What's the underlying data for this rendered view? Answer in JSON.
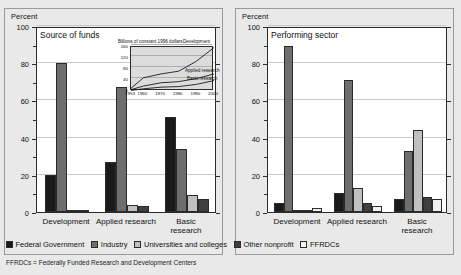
{
  "axis_unit_label": "Percent",
  "panels": [
    {
      "id": "source",
      "title": "Source of funds"
    },
    {
      "id": "sector",
      "title": "Performing sector"
    }
  ],
  "legend": [
    {
      "label": "Federal Government",
      "color": "#1a1a1a"
    },
    {
      "label": "Industry",
      "color": "#6e6e6e"
    },
    {
      "label": "Universities and colleges",
      "color": "#c0c0c0"
    },
    {
      "label": "Other nonprofit",
      "color": "#3f3f3f"
    },
    {
      "label": "FFRDCs",
      "color": "#f2f2f2"
    }
  ],
  "footnote": "FFRDCs = Federally Funded Research and Development Centers",
  "chart_data": [
    {
      "type": "bar",
      "title": "Source of funds",
      "xlabel": "",
      "ylabel": "Percent",
      "ylim": [
        0,
        100
      ],
      "yticks": [
        0,
        20,
        40,
        60,
        80,
        100
      ],
      "grid": true,
      "legend_position": "bottom",
      "categories": [
        "Development",
        "Applied research",
        "Basic research"
      ],
      "series": [
        {
          "name": "Federal Government",
          "color": "#1a1a1a",
          "values": [
            20,
            27,
            51
          ]
        },
        {
          "name": "Industry",
          "color": "#6e6e6e",
          "values": [
            80,
            67,
            34
          ]
        },
        {
          "name": "Universities and colleges",
          "color": "#c0c0c0",
          "values": [
            0.4,
            4,
            9
          ]
        },
        {
          "name": "Other nonprofit",
          "color": "#3f3f3f",
          "values": [
            0.2,
            3,
            7
          ]
        }
      ]
    },
    {
      "type": "bar",
      "title": "Performing sector",
      "xlabel": "",
      "ylabel": "Percent",
      "ylim": [
        0,
        100
      ],
      "yticks": [
        0,
        20,
        40,
        60,
        80,
        100
      ],
      "grid": true,
      "legend_position": "bottom",
      "categories": [
        "Development",
        "Applied research",
        "Basic research"
      ],
      "series": [
        {
          "name": "Federal Government",
          "color": "#1a1a1a",
          "values": [
            5,
            10,
            7
          ]
        },
        {
          "name": "Industry",
          "color": "#6e6e6e",
          "values": [
            89,
            71,
            33
          ]
        },
        {
          "name": "Universities and colleges",
          "color": "#c0c0c0",
          "values": [
            1,
            13,
            44
          ]
        },
        {
          "name": "Other nonprofit",
          "color": "#3f3f3f",
          "values": [
            1,
            5,
            8
          ]
        },
        {
          "name": "FFRDCs",
          "color": "#f2f2f2",
          "values": [
            2,
            3,
            7
          ]
        }
      ]
    },
    {
      "type": "line",
      "title": "Billions of constant 1996 dollars",
      "xlabel": "",
      "ylabel": "",
      "xlim": [
        1953,
        2000
      ],
      "ylim": [
        0,
        160
      ],
      "yticks": [
        0,
        40,
        80,
        120,
        160
      ],
      "xticks": [
        1953,
        1960,
        1970,
        1980,
        1990,
        2000
      ],
      "grid": true,
      "legend_position": "inline",
      "series": [
        {
          "name": "Development",
          "x": [
            1953,
            1960,
            1970,
            1980,
            1990,
            2000
          ],
          "values": [
            10,
            48,
            62,
            72,
            108,
            158
          ]
        },
        {
          "name": "Applied research",
          "x": [
            1953,
            1960,
            1970,
            1980,
            1990,
            2000
          ],
          "values": [
            5,
            18,
            30,
            34,
            45,
            62
          ]
        },
        {
          "name": "Basic research",
          "x": [
            1953,
            1960,
            1970,
            1980,
            1990,
            2000
          ],
          "values": [
            2,
            8,
            14,
            16,
            24,
            38
          ]
        }
      ]
    }
  ]
}
